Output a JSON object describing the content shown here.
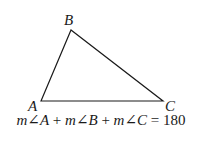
{
  "diagram": {
    "vertices": [
      {
        "name": "A",
        "x": 41,
        "y": 101
      },
      {
        "name": "B",
        "x": 71,
        "y": 30
      },
      {
        "name": "C",
        "x": 163,
        "y": 101
      }
    ],
    "labels": {
      "a": "A",
      "b": "B",
      "c": "C"
    },
    "equation": {
      "t1_m": "m",
      "t1_angle": "∠",
      "t1_v": "A",
      "plus1": " + ",
      "t2_m": "m",
      "t2_angle": "∠",
      "t2_v": "B",
      "plus2": " + ",
      "t3_m": "m",
      "t3_angle": "∠",
      "t3_v": "C",
      "equals": " = ",
      "value": "180",
      "full": "m∠A + m∠B + m∠C = 180"
    },
    "colors": {
      "stroke": "#1a1a1a",
      "background": "#ffffff"
    }
  }
}
